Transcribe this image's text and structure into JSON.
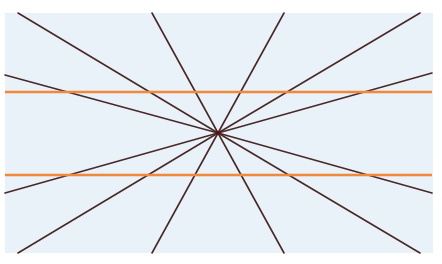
{
  "figure": {
    "background": {
      "x": 5,
      "y": 13,
      "width": 428,
      "height": 240,
      "color": "#e9f1f9"
    },
    "center": {
      "x": 218,
      "y": 133
    },
    "ray_color": "#4a2828",
    "ray_width": 1.6,
    "rays": [
      {
        "x": 18,
        "y": 13
      },
      {
        "x": 152,
        "y": 13
      },
      {
        "x": 284,
        "y": 13
      },
      {
        "x": 420,
        "y": 13
      },
      {
        "x": 432,
        "y": 73
      },
      {
        "x": 432,
        "y": 193
      },
      {
        "x": 420,
        "y": 253
      },
      {
        "x": 284,
        "y": 253
      },
      {
        "x": 152,
        "y": 253
      },
      {
        "x": 18,
        "y": 253
      },
      {
        "x": 5,
        "y": 193
      },
      {
        "x": 5,
        "y": 75
      }
    ],
    "parallel_lines": [
      {
        "y": 92,
        "x1": 5,
        "x2": 432,
        "color": "#f0893a",
        "width": 2.4
      },
      {
        "y": 175,
        "x1": 5,
        "x2": 432,
        "color": "#f0893a",
        "width": 2.4
      }
    ]
  }
}
